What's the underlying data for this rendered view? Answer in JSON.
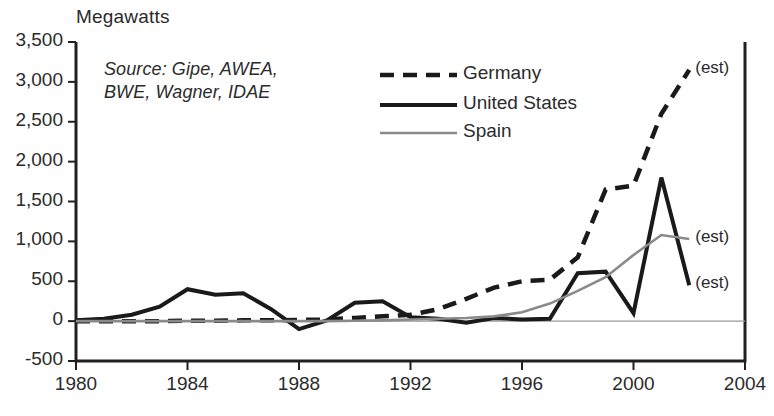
{
  "chart_data": {
    "type": "line",
    "title": "",
    "ylabel": "Megawatts",
    "xlabel": "",
    "xlim": [
      1980,
      2004
    ],
    "ylim": [
      -500,
      3500
    ],
    "grid": false,
    "zero_line": true,
    "legend_position": "upper-center",
    "source_note": "Source: Gipe, AWEA,\nBWE, Wagner, IDAE",
    "x_ticks": [
      "1980",
      "1984",
      "1988",
      "1992",
      "1996",
      "2000",
      "2004"
    ],
    "x_tick_values": [
      1980,
      1984,
      1988,
      1992,
      1996,
      2000,
      2004
    ],
    "y_ticks": [
      "-500",
      "0",
      "500",
      "1,000",
      "1,500",
      "2,000",
      "2,500",
      "3,000",
      "3,500"
    ],
    "y_tick_values": [
      -500,
      0,
      500,
      1000,
      1500,
      2000,
      2500,
      3000,
      3500
    ],
    "x": [
      1980,
      1981,
      1982,
      1983,
      1984,
      1985,
      1986,
      1987,
      1988,
      1989,
      1990,
      1991,
      1992,
      1993,
      1994,
      1995,
      1996,
      1997,
      1998,
      1999,
      2000,
      2001,
      2002
    ],
    "series": [
      {
        "name": "Germany",
        "style": "dashed",
        "color": "#1a1a1a",
        "values": [
          0,
          0,
          0,
          0,
          5,
          5,
          10,
          10,
          15,
          20,
          40,
          60,
          80,
          150,
          280,
          420,
          500,
          520,
          800,
          1650,
          1700,
          2600,
          3150
        ],
        "annotation": "(est)"
      },
      {
        "name": "United States",
        "style": "solid",
        "color": "#1a1a1a",
        "values": [
          10,
          30,
          80,
          180,
          400,
          330,
          350,
          150,
          -100,
          10,
          230,
          250,
          50,
          30,
          -20,
          40,
          20,
          30,
          600,
          620,
          100,
          1800,
          450
        ],
        "annotation": "(est)"
      },
      {
        "name": "Spain",
        "style": "solid",
        "color": "#8a8a8a",
        "values": [
          0,
          0,
          0,
          0,
          0,
          0,
          0,
          0,
          0,
          0,
          5,
          10,
          20,
          30,
          40,
          60,
          110,
          220,
          380,
          550,
          830,
          1080,
          1030
        ],
        "annotation": "(est)"
      }
    ],
    "annotations": [
      {
        "text": "(est)",
        "series": "Germany"
      },
      {
        "text": "(est)",
        "series": "Spain"
      },
      {
        "text": "(est)",
        "series": "United States"
      }
    ]
  },
  "legend": {
    "items": [
      {
        "label": "Germany"
      },
      {
        "label": "United States"
      },
      {
        "label": "Spain"
      }
    ]
  }
}
